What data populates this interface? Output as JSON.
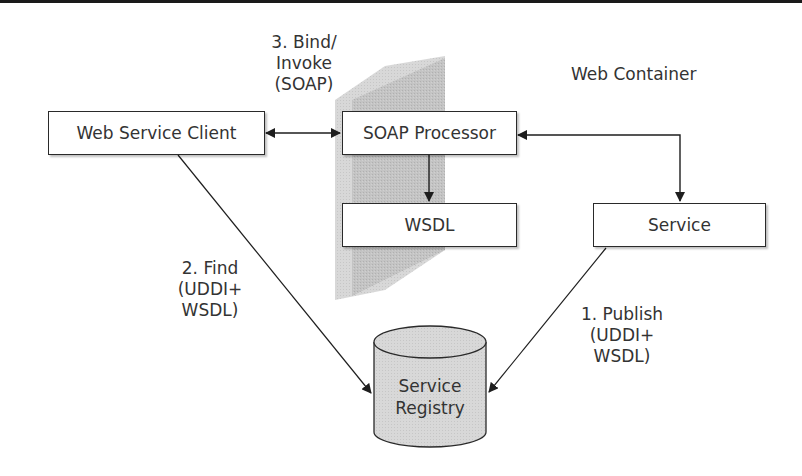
{
  "diagram": {
    "nodes": {
      "client": {
        "label": "Web Service Client"
      },
      "soap_processor": {
        "label": "SOAP Processor"
      },
      "wsdl": {
        "label": "WSDL"
      },
      "service": {
        "label": "Service"
      },
      "registry": {
        "line1": "Service",
        "line2": "Registry"
      }
    },
    "container_label": "Web Container",
    "edges": {
      "bind": {
        "line1": "3. Bind/",
        "line2": "Invoke",
        "line3": "(SOAP)"
      },
      "find": {
        "line1": "2. Find",
        "line2": "(UDDI+",
        "line3": "WSDL)"
      },
      "publish": {
        "line1": "1. Publish",
        "line2": "(UDDI+",
        "line3": "WSDL)"
      }
    },
    "colors": {
      "line": "#2a2a2a",
      "wall": "#c8c8c8",
      "cylinder": "#d6d6d6"
    }
  }
}
